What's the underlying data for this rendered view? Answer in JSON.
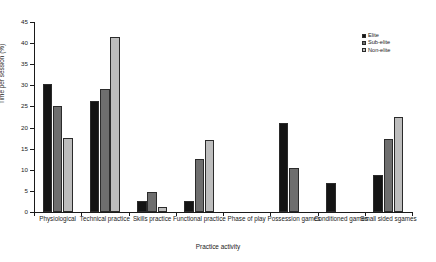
{
  "chart_data": {
    "type": "bar",
    "title": "",
    "xlabel": "Practice activity",
    "ylabel": "Time per session (%)",
    "ylim": [
      0,
      45
    ],
    "yticks": [
      0,
      5,
      10,
      15,
      20,
      25,
      30,
      35,
      40,
      45
    ],
    "grid": false,
    "legend_position": "top-right",
    "categories": [
      "Physiological",
      "Technical practice",
      "Skills practice",
      "Functional practice",
      "Phase of play",
      "Possession games",
      "Conditioned games",
      "Small sided sgames"
    ],
    "series": [
      {
        "name": "Elite",
        "color": "#141414",
        "values": [
          30.4,
          26.4,
          2.5,
          2.7,
          0,
          21.0,
          6.8,
          8.8
        ]
      },
      {
        "name": "Sub-elite",
        "color": "#6e6e6e",
        "values": [
          25.2,
          29.2,
          4.8,
          12.6,
          0,
          10.5,
          0,
          17.4
        ]
      },
      {
        "name": "Non-elite",
        "color": "#bdbdbd",
        "values": [
          17.5,
          41.5,
          1.3,
          17.0,
          0,
          0,
          0,
          22.6
        ]
      }
    ]
  },
  "axis": {
    "y_title": "Time per session (%)",
    "x_title": "Practice activity",
    "y_tick_labels": [
      "0",
      "5",
      "10",
      "15",
      "20",
      "25",
      "30",
      "35",
      "40",
      "45"
    ]
  },
  "legend": {
    "items": [
      {
        "label": "Elite"
      },
      {
        "label": "Sub-elite"
      },
      {
        "label": "Non-elite"
      }
    ]
  },
  "caption": {
    "text": ""
  }
}
